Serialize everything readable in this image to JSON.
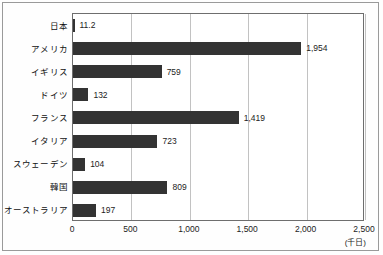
{
  "chart_data": {
    "type": "bar",
    "orientation": "horizontal",
    "title": "",
    "xlabel": "",
    "ylabel": "",
    "unit_label": "(千日)",
    "xlim": [
      0,
      2500
    ],
    "xticks": [
      "0",
      "500",
      "1,000",
      "1,500",
      "2,000",
      "2,500"
    ],
    "xtick_values": [
      0,
      500,
      1000,
      1500,
      2000,
      2500
    ],
    "grid": true,
    "grid_axis": "x",
    "legend": false,
    "categories": [
      "日本",
      "アメリカ",
      "イギリス",
      "ドイツ",
      "フランス",
      "イタリア",
      "スウェーデン",
      "韓国",
      "オーストラリア"
    ],
    "values": [
      11.2,
      1954,
      759,
      132,
      1419,
      723,
      104,
      809,
      197
    ],
    "value_labels": [
      "11.2",
      "1,954",
      "759",
      "132",
      "1,419",
      "723",
      "104",
      "809",
      "197"
    ],
    "bar_color": "#333333",
    "grid_color": "#c2c2c2",
    "frame_color": "#6e6e6e"
  }
}
